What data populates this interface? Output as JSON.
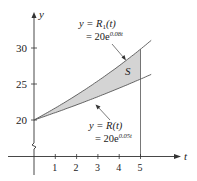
{
  "chart_data": {
    "type": "area",
    "title": "",
    "xlabel": "t",
    "ylabel": "y",
    "x_ticks": [
      "1",
      "2",
      "3",
      "4",
      "5"
    ],
    "y_ticks": [
      "20",
      "25",
      "30"
    ],
    "xlim": [
      0,
      5.6
    ],
    "ylim": [
      20,
      32
    ],
    "y_axis_break": true,
    "grid": false,
    "series": [
      {
        "name": "y = R1(t) = 20e^(0.08t)",
        "x": [
          0,
          1,
          2,
          3,
          4,
          5
        ],
        "values": [
          20.0,
          21.67,
          23.47,
          25.42,
          27.54,
          29.84
        ]
      },
      {
        "name": "y = R(t) = 20e^(0.05t)",
        "x": [
          0,
          1,
          2,
          3,
          4,
          5
        ],
        "values": [
          20.0,
          21.03,
          22.1,
          23.24,
          24.43,
          25.68
        ]
      }
    ],
    "shaded_region": {
      "label": "S",
      "between": [
        "R1(t)",
        "R(t)"
      ],
      "x_range": [
        0,
        5
      ]
    },
    "annotations": [
      {
        "text": "y = R1(t)",
        "line2": "= 20e^0.08t",
        "points_to": "upper curve"
      },
      {
        "text": "y = R(t)",
        "line2": "= 20e^0.05t",
        "points_to": "lower curve"
      },
      {
        "text": "S",
        "location": "shaded region near t=4.5"
      }
    ]
  },
  "labels": {
    "y_axis": "y",
    "x_axis": "t",
    "tick_1": "1",
    "tick_2": "2",
    "tick_3": "3",
    "tick_4": "4",
    "tick_5": "5",
    "ytick_20": "20",
    "ytick_25": "25",
    "ytick_30": "30",
    "upper_eq_a": "y = R",
    "upper_eq_sub": "1",
    "upper_eq_b": "(t)",
    "upper_eq_c": "= 20e",
    "upper_exp": "0.08t",
    "lower_eq_a": "y = R(t)",
    "lower_eq_c": "= 20e",
    "lower_exp": "0.05t",
    "region": "S"
  }
}
